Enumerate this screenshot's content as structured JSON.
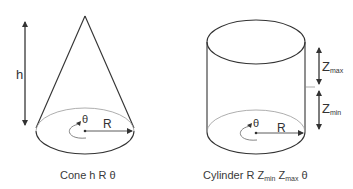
{
  "colors": {
    "stroke": "#333333",
    "light_stroke": "#888888",
    "text": "#333333",
    "background": "#ffffff"
  },
  "cone": {
    "height_label": "h",
    "angle_label": "θ",
    "radius_label": "R",
    "caption": "Cone h R θ"
  },
  "cylinder": {
    "angle_label": "θ",
    "radius_label": "R",
    "zmax_label": {
      "main": "Z",
      "sub": "max"
    },
    "zmin_label": {
      "main": "Z",
      "sub": "min"
    },
    "caption": {
      "prefix": "Cylinder R ",
      "zmin_main": "Z",
      "zmin_sub": "min",
      "zmax_main": " Z",
      "zmax_sub": "max",
      "suffix": " θ"
    }
  }
}
